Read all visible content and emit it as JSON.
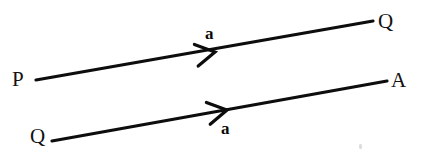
{
  "figure": {
    "type": "vector-diagram",
    "background_color": "#ffffff",
    "stroke_color": "#0d0d0d",
    "text_color": "#111111",
    "width": 425,
    "height": 157
  },
  "vectors": [
    {
      "id": "vector-pq",
      "label": "a",
      "label_position": "above",
      "tail_label": "P",
      "head_label": "Q",
      "tail": {
        "x": 36,
        "y": 80
      },
      "head": {
        "x": 373,
        "y": 21
      },
      "arrowhead": {
        "x": 215,
        "y": 52
      },
      "label_point": {
        "x": 205,
        "y": 25
      },
      "tail_label_point": {
        "x": 12,
        "y": 69
      },
      "head_label_point": {
        "x": 378,
        "y": 11
      }
    },
    {
      "id": "vector-qa",
      "label": "a",
      "label_position": "below",
      "tail_label": "Q",
      "head_label": "A",
      "tail": {
        "x": 52,
        "y": 141
      },
      "head": {
        "x": 387,
        "y": 81
      },
      "arrowhead": {
        "x": 227,
        "y": 110
      },
      "label_point": {
        "x": 221,
        "y": 120
      },
      "tail_label_point": {
        "x": 30,
        "y": 126
      },
      "head_label_point": {
        "x": 391,
        "y": 70
      }
    }
  ],
  "labels": {
    "top_vector_name": "a",
    "top_tail_point": "P",
    "top_head_point": "Q",
    "bottom_vector_name": "a",
    "bottom_tail_point": "Q",
    "bottom_head_point": "A"
  },
  "artifacts": [
    {
      "id": "scan-speck",
      "x": 359,
      "y": 144,
      "width": 3,
      "height": 5,
      "color": "#dcdcdc"
    }
  ]
}
